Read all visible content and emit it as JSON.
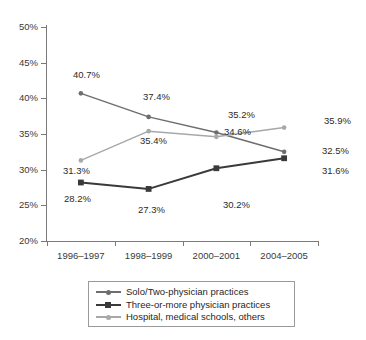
{
  "chart_data": {
    "type": "line",
    "title": "",
    "subtitle": "",
    "xlabel": "",
    "ylabel": "",
    "categories": [
      "1996–1997",
      "1998–1999",
      "2000–2001",
      "2004–2005"
    ],
    "ylim": [
      20,
      50
    ],
    "ytick_labels": [
      "50%",
      "45%",
      "40%",
      "35%",
      "30%",
      "25%",
      "20%"
    ],
    "ytick_values": [
      50,
      45,
      40,
      35,
      30,
      25,
      20
    ],
    "grid": false,
    "legend_position": "bottom",
    "series": [
      {
        "name": "Solo/Two-physician practices",
        "color": "#6e6e6e",
        "marker": "circle",
        "values": [
          40.7,
          37.4,
          35.2,
          32.5
        ],
        "data_labels": [
          "40.7%",
          "37.4%",
          "35.2%",
          "32.5%"
        ],
        "label_position": "above"
      },
      {
        "name": "Three-or-more physician practices",
        "color": "#3a3a3a",
        "marker": "square",
        "values": [
          28.2,
          27.3,
          30.2,
          31.6
        ],
        "data_labels": [
          "28.2%",
          "27.3%",
          "30.2%",
          "31.6%"
        ],
        "label_position": "below"
      },
      {
        "name": "Hospital, medical schools, others",
        "color": "#a8a8a8",
        "marker": "circle",
        "values": [
          31.3,
          35.4,
          34.6,
          35.9
        ],
        "data_labels": [
          "31.3%",
          "35.4%",
          "34.6%",
          "35.9%"
        ],
        "label_position": "mixed"
      }
    ]
  },
  "axis": {
    "y_ticks": [
      {
        "label": "50%"
      },
      {
        "label": "45%"
      },
      {
        "label": "40%"
      },
      {
        "label": "35%"
      },
      {
        "label": "30%"
      },
      {
        "label": "25%"
      },
      {
        "label": "20%"
      }
    ],
    "x_categories": [
      {
        "label": "1996–1997"
      },
      {
        "label": "1998–1999"
      },
      {
        "label": "2000–2001"
      },
      {
        "label": "2004–2005"
      }
    ]
  },
  "legend": {
    "items": [
      {
        "label": "Solo/Two-physician practices",
        "color": "#6e6e6e",
        "marker": "circle"
      },
      {
        "label": "Three-or-more physician practices",
        "color": "#3a3a3a",
        "marker": "square"
      },
      {
        "label": "Hospital, medical schools, others",
        "color": "#a8a8a8",
        "marker": "circle"
      }
    ]
  },
  "point_labels": [
    {
      "text": "40.7%",
      "x": 73,
      "y": 70
    },
    {
      "text": "37.4%",
      "x": 143,
      "y": 92
    },
    {
      "text": "35.2%",
      "x": 228,
      "y": 110
    },
    {
      "text": "32.5%",
      "x": 322,
      "y": 146
    },
    {
      "text": "28.2%",
      "x": 64,
      "y": 194
    },
    {
      "text": "27.3%",
      "x": 138,
      "y": 205
    },
    {
      "text": "30.2%",
      "x": 223,
      "y": 200
    },
    {
      "text": "31.6%",
      "x": 322,
      "y": 166
    },
    {
      "text": "31.3%",
      "x": 63,
      "y": 166
    },
    {
      "text": "35.4%",
      "x": 140,
      "y": 136
    },
    {
      "text": "34.6%",
      "x": 224,
      "y": 127
    },
    {
      "text": "35.9%",
      "x": 324,
      "y": 116
    }
  ],
  "colors": {
    "axis": "#7a7a7a",
    "series1": "#6e6e6e",
    "series2": "#3a3a3a",
    "series3": "#a8a8a8",
    "text": "#2b2b2b",
    "background": "#ffffff"
  }
}
